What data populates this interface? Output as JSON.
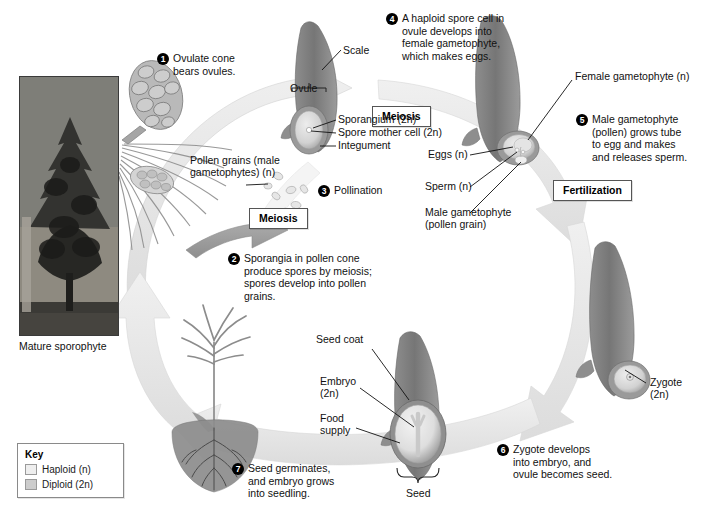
{
  "figure": {
    "background": "#ffffff"
  },
  "colors": {
    "haploid": "#e9e9e9",
    "diploid": "#c9c9c9",
    "arrow_haploid": "#e2e2e2",
    "arrow_diploid": "#9a9a9a",
    "scale_dark": "#7e7e7e",
    "outline": "#555555",
    "text": "#111111"
  },
  "steps": [
    {
      "num": "1",
      "text": "Ovulate cone\nbears ovules."
    },
    {
      "num": "2",
      "text": "Sporangia in pollen cone\nproduce spores by meiosis;\nspores develop into pollen\ngrains."
    },
    {
      "num": "3",
      "text": "Pollination"
    },
    {
      "num": "4",
      "text": "A haploid spore cell in\novule develops into\nfemale gametophyte,\nwhich makes eggs."
    },
    {
      "num": "5",
      "text": "Male gametophyte\n(pollen) grows tube\nto egg and makes\nand releases sperm."
    },
    {
      "num": "6",
      "text": "Zygote develops\ninto embryo, and\novule becomes seed."
    },
    {
      "num": "7",
      "text": "Seed germinates,\nand embryo grows\ninto seedling."
    }
  ],
  "process_boxes": [
    {
      "label": "Meiosis",
      "id": "meiosis-top"
    },
    {
      "label": "Meiosis",
      "id": "meiosis-left"
    },
    {
      "label": "Fertilization",
      "id": "fertilization"
    }
  ],
  "labels": {
    "scale": "Scale",
    "ovule": "Ovule",
    "sporangium": "Sporangium (2n)",
    "spore_mother_cell": "Spore mother cell (2n)",
    "integument": "Integument",
    "pollen_grains": "Pollen grains (male\ngametophytes) (n)",
    "female_gametophyte": "Female gametophyte (n)",
    "eggs": "Eggs (n)",
    "sperm": "Sperm (n)",
    "male_gametophyte": "Male gametophyte\n(pollen grain)",
    "zygote": "Zygote\n(2n)",
    "seed_coat": "Seed coat",
    "embryo": "Embryo\n(2n)",
    "food_supply": "Food\nsupply",
    "seed": "Seed",
    "mature_sporophyte": "Mature sporophyte"
  },
  "key": {
    "title": "Key",
    "items": [
      {
        "label": "Haploid (n)",
        "swatch": "#eeeeee"
      },
      {
        "label": "Diploid (2n)",
        "swatch": "#cccccc"
      }
    ]
  },
  "photo": {
    "alt": "Mature pine tree sporophyte photograph"
  }
}
